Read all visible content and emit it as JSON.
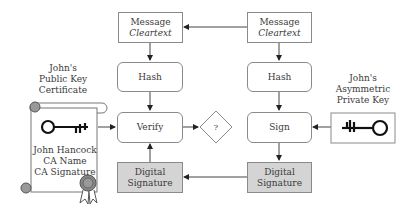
{
  "left_column": {
    "message": {
      "line1": "Message",
      "line2": "Cleartext"
    },
    "hash": "Hash",
    "verify": "Verify",
    "digital_signature": {
      "line1": "Digital",
      "line2": "Signature"
    }
  },
  "right_column": {
    "message": {
      "line1": "Message",
      "line2": "Cleartext"
    },
    "hash": "Hash",
    "sign": "Sign",
    "digital_signature": {
      "line1": "Digital",
      "line2": "Signature"
    }
  },
  "decision": {
    "label": "?"
  },
  "certificate": {
    "title": {
      "line1": "John's",
      "line2": "Public Key",
      "line3": "Certificate"
    },
    "body": {
      "line1": "John Hancock",
      "line2": "CA Name",
      "line3": "CA Signature"
    },
    "icons": [
      "scroll-icon",
      "public-key-icon",
      "seal-ribbon-icon"
    ]
  },
  "private_key": {
    "title": {
      "line1": "John's",
      "line2": "Asymmetric",
      "line3": "Private Key"
    },
    "icon": "private-key-icon"
  },
  "colors": {
    "stroke": "#8a8a8a",
    "shaded_fill": "#d4d4d4",
    "key": "#111111"
  }
}
